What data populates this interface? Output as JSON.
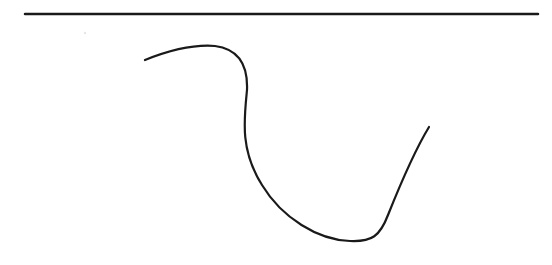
{
  "canvas": {
    "width": 552,
    "height": 265,
    "background": "#ffffff"
  },
  "stroke_color": "#1a1a1a",
  "elements": {
    "top_line": {
      "x1": 25,
      "y1": 14,
      "x2": 538,
      "y2": 14,
      "stroke_width": 2.5
    },
    "curve": {
      "stroke_width": 2.2,
      "path": "M145,60 C165,52 190,44 215,46 C238,49 248,65 247,90 C244,120 240,150 262,185 C282,218 318,240 350,241 C372,242 380,236 388,215 C398,190 412,155 429,127"
    },
    "faint_mark": {
      "x": 85,
      "y": 33
    }
  }
}
